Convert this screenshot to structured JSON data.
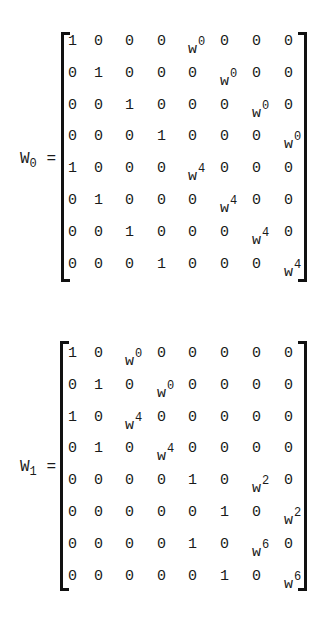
{
  "matrices": [
    {
      "name": "W",
      "subscript": "0",
      "equals": "=",
      "rows": [
        [
          {
            "b": "1"
          },
          {
            "b": "0"
          },
          {
            "b": "0"
          },
          {
            "b": "0"
          },
          {
            "b": "w",
            "e": "0"
          },
          {
            "b": "0"
          },
          {
            "b": "0"
          },
          {
            "b": "0"
          }
        ],
        [
          {
            "b": "0"
          },
          {
            "b": "1"
          },
          {
            "b": "0"
          },
          {
            "b": "0"
          },
          {
            "b": "0"
          },
          {
            "b": "w",
            "e": "0"
          },
          {
            "b": "0"
          },
          {
            "b": "0"
          }
        ],
        [
          {
            "b": "0"
          },
          {
            "b": "0"
          },
          {
            "b": "1"
          },
          {
            "b": "0"
          },
          {
            "b": "0"
          },
          {
            "b": "0"
          },
          {
            "b": "w",
            "e": "0"
          },
          {
            "b": "0"
          }
        ],
        [
          {
            "b": "0"
          },
          {
            "b": "0"
          },
          {
            "b": "0"
          },
          {
            "b": "1"
          },
          {
            "b": "0"
          },
          {
            "b": "0"
          },
          {
            "b": "0"
          },
          {
            "b": "w",
            "e": "0"
          }
        ],
        [
          {
            "b": "1"
          },
          {
            "b": "0"
          },
          {
            "b": "0"
          },
          {
            "b": "0"
          },
          {
            "b": "w",
            "e": "4"
          },
          {
            "b": "0"
          },
          {
            "b": "0"
          },
          {
            "b": "0"
          }
        ],
        [
          {
            "b": "0"
          },
          {
            "b": "1"
          },
          {
            "b": "0"
          },
          {
            "b": "0"
          },
          {
            "b": "0"
          },
          {
            "b": "w",
            "e": "4"
          },
          {
            "b": "0"
          },
          {
            "b": "0"
          }
        ],
        [
          {
            "b": "0"
          },
          {
            "b": "0"
          },
          {
            "b": "1"
          },
          {
            "b": "0"
          },
          {
            "b": "0"
          },
          {
            "b": "0"
          },
          {
            "b": "w",
            "e": "4"
          },
          {
            "b": "0"
          }
        ],
        [
          {
            "b": "0"
          },
          {
            "b": "0"
          },
          {
            "b": "0"
          },
          {
            "b": "1"
          },
          {
            "b": "0"
          },
          {
            "b": "0"
          },
          {
            "b": "0"
          },
          {
            "b": "w",
            "e": "4"
          }
        ]
      ]
    },
    {
      "name": "W",
      "subscript": "1",
      "equals": "=",
      "rows": [
        [
          {
            "b": "1"
          },
          {
            "b": "0"
          },
          {
            "b": "w",
            "e": "0"
          },
          {
            "b": "0"
          },
          {
            "b": "0"
          },
          {
            "b": "0"
          },
          {
            "b": "0"
          },
          {
            "b": "0"
          }
        ],
        [
          {
            "b": "0"
          },
          {
            "b": "1"
          },
          {
            "b": "0"
          },
          {
            "b": "w",
            "e": "0"
          },
          {
            "b": "0"
          },
          {
            "b": "0"
          },
          {
            "b": "0"
          },
          {
            "b": "0"
          }
        ],
        [
          {
            "b": "1"
          },
          {
            "b": "0"
          },
          {
            "b": "w",
            "e": "4"
          },
          {
            "b": "0"
          },
          {
            "b": "0"
          },
          {
            "b": "0"
          },
          {
            "b": "0"
          },
          {
            "b": "0"
          }
        ],
        [
          {
            "b": "0"
          },
          {
            "b": "1"
          },
          {
            "b": "0"
          },
          {
            "b": "w",
            "e": "4"
          },
          {
            "b": "0"
          },
          {
            "b": "0"
          },
          {
            "b": "0"
          },
          {
            "b": "0"
          }
        ],
        [
          {
            "b": "0"
          },
          {
            "b": "0"
          },
          {
            "b": "0"
          },
          {
            "b": "0"
          },
          {
            "b": "1"
          },
          {
            "b": "0"
          },
          {
            "b": "w",
            "e": "2"
          },
          {
            "b": "0"
          }
        ],
        [
          {
            "b": "0"
          },
          {
            "b": "0"
          },
          {
            "b": "0"
          },
          {
            "b": "0"
          },
          {
            "b": "0"
          },
          {
            "b": "1"
          },
          {
            "b": "0"
          },
          {
            "b": "w",
            "e": "2"
          }
        ],
        [
          {
            "b": "0"
          },
          {
            "b": "0"
          },
          {
            "b": "0"
          },
          {
            "b": "0"
          },
          {
            "b": "1"
          },
          {
            "b": "0"
          },
          {
            "b": "w",
            "e": "6"
          },
          {
            "b": "0"
          }
        ],
        [
          {
            "b": "0"
          },
          {
            "b": "0"
          },
          {
            "b": "0"
          },
          {
            "b": "0"
          },
          {
            "b": "0"
          },
          {
            "b": "1"
          },
          {
            "b": "0"
          },
          {
            "b": "w",
            "e": "6"
          }
        ]
      ]
    }
  ]
}
